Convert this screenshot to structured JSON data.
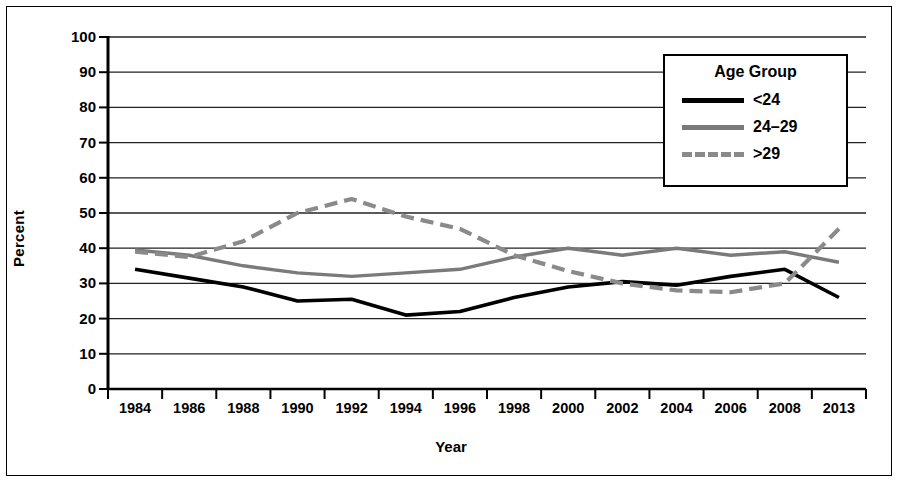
{
  "chart_data": {
    "type": "line",
    "title": "",
    "xlabel": "Year",
    "ylabel": "Percent",
    "ylim": [
      0,
      100
    ],
    "ytick_step": 10,
    "grid": "horizontal",
    "legend_position": "upper-right",
    "legend_title": "Age Group",
    "categories": [
      "1984",
      "1986",
      "1988",
      "1990",
      "1992",
      "1994",
      "1996",
      "1998",
      "2000",
      "2002",
      "2004",
      "2006",
      "2008",
      "2013"
    ],
    "yticks": [
      "0",
      "10",
      "20",
      "30",
      "40",
      "50",
      "60",
      "70",
      "80",
      "90",
      "100"
    ],
    "series": [
      {
        "name": "<24",
        "style": "solid",
        "color": "#000000",
        "values": [
          34,
          31.5,
          29,
          25,
          25.5,
          21,
          22,
          26,
          29,
          30.5,
          29.5,
          32,
          34,
          26
        ]
      },
      {
        "name": "24–29",
        "style": "solid",
        "color": "#7a7a7a",
        "values": [
          39.5,
          38,
          35,
          33,
          32,
          33,
          34,
          37.5,
          40,
          38,
          40,
          38,
          39,
          36
        ]
      },
      {
        "name": ">29",
        "style": "dashed",
        "color": "#8a8a8a",
        "values": [
          39,
          37.5,
          42,
          50,
          54,
          49,
          45.5,
          38,
          33.5,
          30,
          28,
          27.5,
          30,
          45.5
        ]
      }
    ]
  }
}
